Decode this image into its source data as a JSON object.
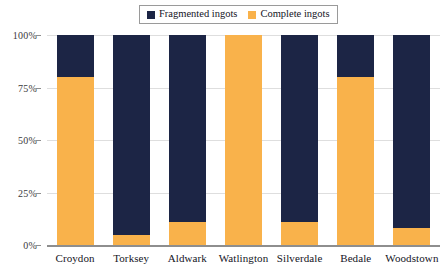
{
  "chart_data": {
    "type": "bar",
    "subtype": "stacked-100-percent",
    "title": "",
    "xlabel": "",
    "ylabel": "",
    "ylim": [
      0,
      100
    ],
    "y_ticks": [
      "0%",
      "25%",
      "50%",
      "75%",
      "100%"
    ],
    "y_tick_values": [
      0,
      25,
      50,
      75,
      100
    ],
    "grid": true,
    "legend_position": "top-center",
    "categories": [
      "Croydon",
      "Torksey",
      "Aldwark",
      "Watlington",
      "Silverdale",
      "Bedale",
      "Woodstown"
    ],
    "series": [
      {
        "name": "Fragmented ingots",
        "color": "#1c2545",
        "values": [
          20,
          95,
          89,
          0,
          89,
          20,
          92
        ]
      },
      {
        "name": "Complete ingots",
        "color": "#f9b24b",
        "values": [
          80,
          5,
          11,
          100,
          11,
          80,
          8
        ]
      }
    ]
  },
  "legend": {
    "entries": [
      {
        "label": "Fragmented ingots",
        "color": "#1c2545",
        "icon": "legend-swatch-icon"
      },
      {
        "label": "Complete ingots",
        "color": "#f9b24b",
        "icon": "legend-swatch-icon"
      }
    ]
  },
  "colors": {
    "fragmented": "#1c2545",
    "complete": "#f9b24b",
    "gridline": "#dedede",
    "axis": "#8e8e8e",
    "background": "#ffffff",
    "text": "#14141e"
  }
}
